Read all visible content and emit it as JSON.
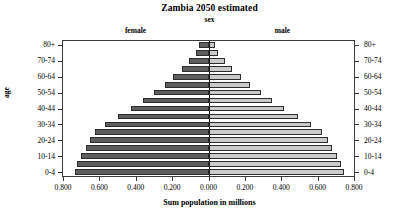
{
  "chart": {
    "title": "Zambia 2050 estimated",
    "subtitle": "sex",
    "panel_female_label": "female",
    "panel_male_label": "male",
    "xlabel": "Sum population in millions",
    "ylabel": "age"
  },
  "colors": {
    "female_bar": "#5e5e5e",
    "male_bar": "#c9c9c9",
    "axis": "#3a3a3a",
    "background": "#ffffff"
  },
  "chart_data": {
    "type": "bar",
    "title": "Zambia 2050 estimated",
    "subtitle": "sex",
    "xlabel": "Sum population in millions",
    "ylabel": "age",
    "orientation": "horizontal",
    "layout": "population-pyramid",
    "grid": false,
    "legend": "panel-strip-labels",
    "xlim": [
      0.9,
      0.9
    ],
    "xticks_left": [
      "0.800",
      "0.600",
      "0.400",
      "0.200",
      "0.000"
    ],
    "xticks_right": [
      "0.200",
      "0.400",
      "0.600",
      "0.800"
    ],
    "xtick_values": [
      0.8,
      0.6,
      0.4,
      0.2,
      0.0,
      0.2,
      0.4,
      0.6,
      0.8
    ],
    "categories": [
      "0-4",
      "5-9",
      "10-14",
      "15-19",
      "20-24",
      "25-29",
      "30-34",
      "35-39",
      "40-44",
      "45-49",
      "50-54",
      "55-59",
      "60-64",
      "65-69",
      "70-74",
      "75-79",
      "80+"
    ],
    "ytick_labels_shown": [
      "0-4",
      "10-14",
      "20-24",
      "30-34",
      "40-44",
      "50-54",
      "60-64",
      "70-74",
      "80+"
    ],
    "series": [
      {
        "name": "female",
        "side": "left",
        "color": "#5e5e5e",
        "values": [
          0.828,
          0.812,
          0.786,
          0.76,
          0.734,
          0.7,
          0.638,
          0.562,
          0.48,
          0.404,
          0.336,
          0.272,
          0.218,
          0.164,
          0.118,
          0.076,
          0.06
        ]
      },
      {
        "name": "male",
        "side": "right",
        "color": "#c9c9c9",
        "values": [
          0.836,
          0.82,
          0.792,
          0.766,
          0.738,
          0.702,
          0.636,
          0.556,
          0.47,
          0.392,
          0.322,
          0.258,
          0.2,
          0.146,
          0.1,
          0.06,
          0.04
        ]
      }
    ]
  }
}
